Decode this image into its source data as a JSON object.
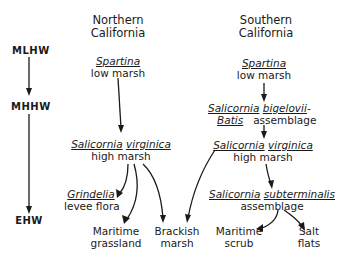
{
  "tide_levels": [
    {
      "id": "mlhw",
      "label": "MLHW"
    },
    {
      "id": "mhhw",
      "label": "MHHW"
    },
    {
      "id": "ehw",
      "label": "EHW"
    }
  ],
  "northern": {
    "header_line1": "Northern",
    "header_line2": "California",
    "low_marsh": {
      "species": "Spartina",
      "desc": "low marsh"
    },
    "high_marsh": {
      "genus": "Salicornia",
      "species": "virginica",
      "desc": "high marsh"
    },
    "levee": {
      "species": "Grindelia",
      "desc": "levee flora"
    },
    "grassland": {
      "line1": "Maritime",
      "line2": "grassland"
    },
    "brackish": {
      "line1": "Brackish",
      "line2": "marsh"
    }
  },
  "southern": {
    "header_line1": "Southern",
    "header_line2": "California",
    "low_marsh": {
      "species": "Spartina",
      "desc": "low marsh"
    },
    "bigelovii": {
      "genus": "Salicornia",
      "species": "bigelovii",
      "dash": "-",
      "genus2": "Batis",
      "desc": "assemblage"
    },
    "high_marsh": {
      "genus": "Salicornia",
      "species": "virginica",
      "desc": "high marsh"
    },
    "subterminalis": {
      "genus": "Salicornia",
      "species": "subterminalis",
      "desc": "assemblage"
    },
    "scrub": {
      "line1": "Maritime",
      "line2": "scrub"
    },
    "salt_flats": {
      "line1": "Salt",
      "line2": "flats"
    }
  }
}
